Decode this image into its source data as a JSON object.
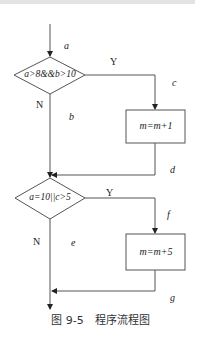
{
  "diagram": {
    "type": "flowchart",
    "nodes": [
      {
        "id": "d1",
        "shape": "diamond",
        "text": "a>8&&b>10"
      },
      {
        "id": "p1",
        "shape": "rect",
        "text": "m=m+1"
      },
      {
        "id": "d2",
        "shape": "diamond",
        "text": "a=10||c>5"
      },
      {
        "id": "p2",
        "shape": "rect",
        "text": "m=m+5"
      }
    ],
    "edges": [
      {
        "from": "start",
        "to": "d1",
        "label": "a"
      },
      {
        "from": "d1",
        "to": "p1",
        "branch": "Y",
        "label": "c"
      },
      {
        "from": "d1",
        "to": "d2",
        "branch": "N",
        "label": "b"
      },
      {
        "from": "p1",
        "to": "d2",
        "label": "d"
      },
      {
        "from": "d2",
        "to": "p2",
        "branch": "Y",
        "label": "f"
      },
      {
        "from": "d2",
        "to": "end",
        "branch": "N",
        "label": "e"
      },
      {
        "from": "p2",
        "to": "end",
        "label": "g"
      }
    ]
  },
  "labels": {
    "edge_a": "a",
    "edge_b": "b",
    "edge_c": "c",
    "edge_d": "d",
    "edge_e": "e",
    "edge_f": "f",
    "edge_g": "g",
    "yes1": "Y",
    "no1": "N",
    "yes2": "Y",
    "no2": "N",
    "cond1": "a>8&&b>10",
    "cond2": "a=10||c>5",
    "proc1": "m=m+1",
    "proc2": "m=m+5"
  },
  "caption": "图 9-5　程序流程图"
}
